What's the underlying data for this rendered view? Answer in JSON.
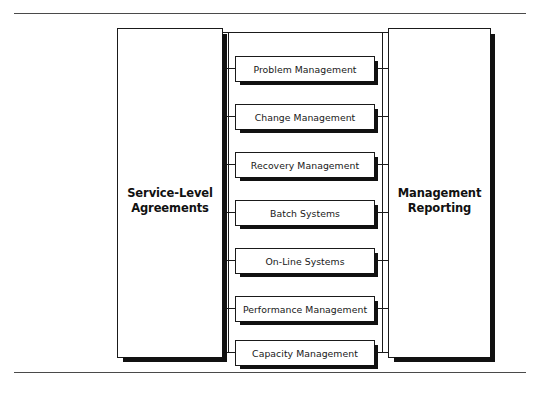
{
  "diagram": {
    "left_pillar": {
      "name": "Service-Level Agreements",
      "line1": "Service-Level",
      "line2": "Agreements"
    },
    "right_pillar": {
      "name": "Management Reporting",
      "line1": "Management",
      "line2": "Reporting"
    },
    "services": [
      {
        "label": "Problem Management"
      },
      {
        "label": "Change Management"
      },
      {
        "label": "Recovery Management"
      },
      {
        "label": "Batch Systems"
      },
      {
        "label": "On-Line Systems"
      },
      {
        "label": "Performance Management"
      },
      {
        "label": "Capacity Management"
      }
    ],
    "colors": {
      "line": "#1a1a1a",
      "shadow": "#111111",
      "rule": "#4a4a4a",
      "background": "#ffffff",
      "text": "#181818"
    }
  }
}
